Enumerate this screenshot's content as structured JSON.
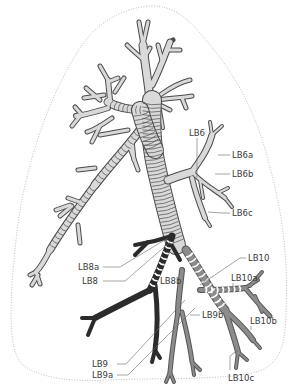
{
  "diagram": {
    "colors": {
      "upper_bronchi_fill": "#d9d9d9",
      "outline_stroke": "#4a4a4a",
      "LB8_segment": "#2b2b2b",
      "LB9_LB10_segments": "#8c8c8c",
      "lung_outline": "#b5b5b5",
      "label_text": "#3a3a3a"
    },
    "labels": {
      "LB6": "LB6",
      "LB6a": "LB6a",
      "LB6b": "LB6b",
      "LB6c": "LB6c",
      "LB8a": "LB8a",
      "LB8": "LB8",
      "LB8b": "LB8b",
      "LB9": "LB9",
      "LB9a": "LB9a",
      "LB9b": "LB9b",
      "LB10": "LB10",
      "LB10a": "LB10a",
      "LB10b": "LB10b",
      "LB10c": "LB10c"
    }
  }
}
